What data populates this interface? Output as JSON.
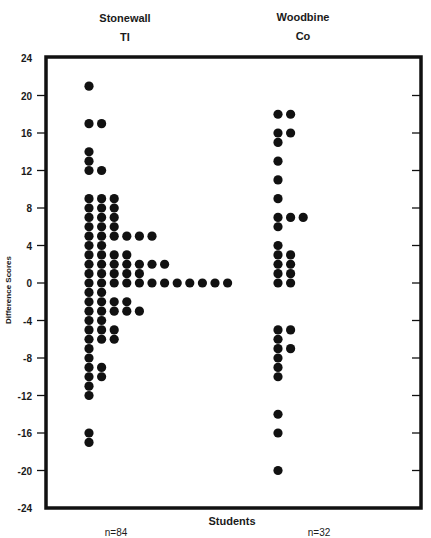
{
  "chart_data": {
    "type": "scatter",
    "subtype": "dot-plot",
    "title": "",
    "xlabel": "Students",
    "ylabel": "Difference Scores",
    "ylim": [
      -24,
      24
    ],
    "yticks": [
      24,
      20,
      16,
      12,
      8,
      4,
      0,
      -4,
      -8,
      -12,
      -16,
      -20,
      -24
    ],
    "ytick_labels": [
      "24",
      "20",
      "16",
      "12",
      "8",
      "4",
      "0",
      "-4",
      "-8",
      "-12",
      "-16",
      "-20",
      "-24"
    ],
    "grid": false,
    "legend": "none",
    "groups": [
      {
        "name": "Stonewall",
        "subname": "TI",
        "n_label": "n=84",
        "n": 84,
        "counts": [
          {
            "value": 21,
            "count": 1
          },
          {
            "value": 17,
            "count": 2
          },
          {
            "value": 14,
            "count": 1
          },
          {
            "value": 13,
            "count": 1
          },
          {
            "value": 12,
            "count": 2
          },
          {
            "value": 9,
            "count": 3
          },
          {
            "value": 8,
            "count": 3
          },
          {
            "value": 7,
            "count": 3
          },
          {
            "value": 6,
            "count": 3
          },
          {
            "value": 5,
            "count": 6
          },
          {
            "value": 4,
            "count": 2
          },
          {
            "value": 3,
            "count": 4
          },
          {
            "value": 2,
            "count": 7
          },
          {
            "value": 1,
            "count": 5
          },
          {
            "value": 0,
            "count": 12
          },
          {
            "value": -1,
            "count": 2
          },
          {
            "value": -2,
            "count": 4
          },
          {
            "value": -3,
            "count": 5
          },
          {
            "value": -4,
            "count": 2
          },
          {
            "value": -5,
            "count": 3
          },
          {
            "value": -6,
            "count": 3
          },
          {
            "value": -7,
            "count": 1
          },
          {
            "value": -8,
            "count": 1
          },
          {
            "value": -9,
            "count": 2
          },
          {
            "value": -10,
            "count": 2
          },
          {
            "value": -11,
            "count": 1
          },
          {
            "value": -12,
            "count": 1
          },
          {
            "value": -16,
            "count": 1
          },
          {
            "value": -17,
            "count": 1
          }
        ]
      },
      {
        "name": "Woodbine",
        "subname": "Co",
        "n_label": "n=32",
        "n": 32,
        "counts": [
          {
            "value": 18,
            "count": 2
          },
          {
            "value": 16,
            "count": 2
          },
          {
            "value": 15,
            "count": 1
          },
          {
            "value": 13,
            "count": 1
          },
          {
            "value": 11,
            "count": 1
          },
          {
            "value": 9,
            "count": 1
          },
          {
            "value": 7,
            "count": 3
          },
          {
            "value": 6,
            "count": 1
          },
          {
            "value": 4,
            "count": 1
          },
          {
            "value": 3,
            "count": 2
          },
          {
            "value": 2,
            "count": 2
          },
          {
            "value": 1,
            "count": 2
          },
          {
            "value": 0,
            "count": 2
          },
          {
            "value": -5,
            "count": 2
          },
          {
            "value": -6,
            "count": 1
          },
          {
            "value": -7,
            "count": 2
          },
          {
            "value": -8,
            "count": 1
          },
          {
            "value": -9,
            "count": 1
          },
          {
            "value": -10,
            "count": 1
          },
          {
            "value": -14,
            "count": 1
          },
          {
            "value": -16,
            "count": 1
          },
          {
            "value": -20,
            "count": 1
          }
        ]
      }
    ]
  },
  "colors": {
    "ink": "#111111",
    "background": "#ffffff"
  }
}
